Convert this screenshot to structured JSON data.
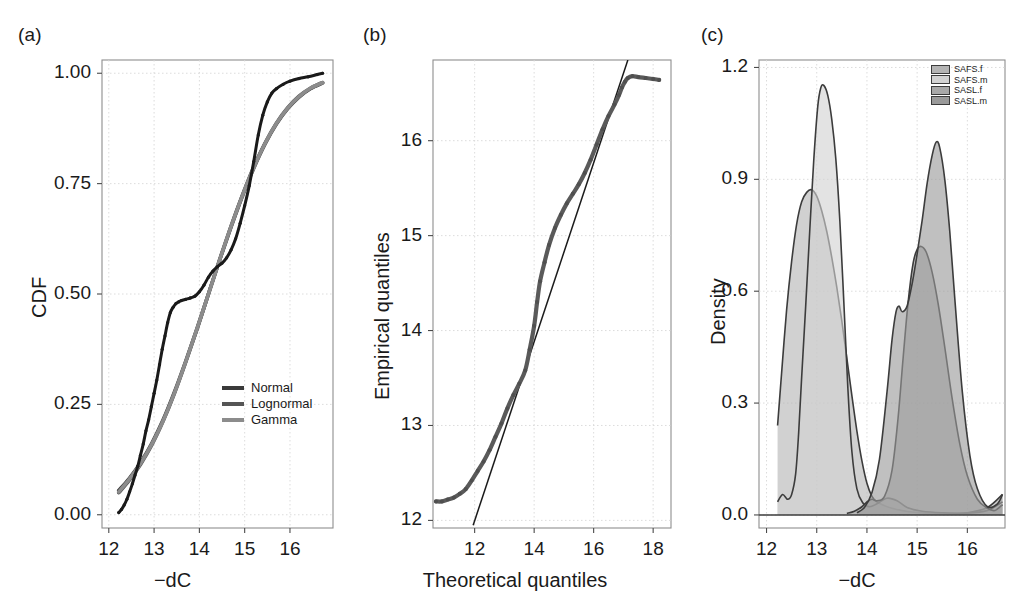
{
  "figure": {
    "width": 1029,
    "height": 614,
    "background": "#ffffff"
  },
  "panels": [
    {
      "label": "(a)",
      "name": "cdf-panel",
      "xlabel": "−dC",
      "ylabel": "CDF",
      "xticks": [
        "12",
        "13",
        "14",
        "15",
        "16"
      ],
      "yticks": [
        "0.00",
        "0.25",
        "0.50",
        "0.75",
        "1.00"
      ],
      "legend": [
        {
          "label": "Normal",
          "color": "#3a3a3a"
        },
        {
          "label": "Lognormal",
          "color": "#555555"
        },
        {
          "label": "Gamma",
          "color": "#8c8c8c"
        }
      ]
    },
    {
      "label": "(b)",
      "name": "qq-panel",
      "xlabel": "Theoretical quantiles",
      "ylabel": "Empirical quantiles",
      "xticks": [
        "12",
        "14",
        "16",
        "18"
      ],
      "yticks": [
        "12",
        "13",
        "14",
        "15",
        "16"
      ]
    },
    {
      "label": "(c)",
      "name": "density-panel",
      "xlabel": "−dC",
      "ylabel": "Density",
      "xticks": [
        "12",
        "13",
        "14",
        "15",
        "16"
      ],
      "yticks": [
        "0.0",
        "0.3",
        "0.6",
        "0.9",
        "1.2"
      ],
      "legend": [
        {
          "label": "SAFS.f",
          "color": "#b4b4b4"
        },
        {
          "label": "SAFS.m",
          "color": "#d2d2d2"
        },
        {
          "label": "SASL.f",
          "color": "#a8a8a8"
        },
        {
          "label": "SASL.m",
          "color": "#9a9a9a"
        }
      ]
    }
  ],
  "chart_data": [
    {
      "type": "line",
      "panel": "(a)",
      "title": "",
      "xlabel": "−dC",
      "ylabel": "CDF",
      "xlim": [
        11.85,
        16.95
      ],
      "ylim": [
        -0.03,
        1.03
      ],
      "grid": true,
      "legend_position": "bottom-right",
      "xticks": [
        12,
        13,
        14,
        15,
        16
      ],
      "yticks": [
        0.0,
        0.25,
        0.5,
        0.75,
        1.0
      ],
      "series": [
        {
          "name": "Empirical",
          "color": "#1a1a1a",
          "style": "points",
          "x": [
            12.22,
            12.28,
            12.34,
            12.4,
            12.46,
            12.52,
            12.58,
            12.64,
            12.7,
            12.76,
            12.82,
            12.88,
            12.94,
            13.0,
            13.06,
            13.12,
            13.18,
            13.24,
            13.3,
            13.36,
            13.42,
            13.48,
            13.54,
            13.6,
            13.7,
            13.8,
            13.9,
            14.0,
            14.1,
            14.2,
            14.3,
            14.4,
            14.5,
            14.6,
            14.7,
            14.8,
            14.9,
            15.0,
            15.1,
            15.2,
            15.3,
            15.4,
            15.5,
            15.6,
            15.7,
            15.85,
            16.0,
            16.2,
            16.4,
            16.6,
            16.72
          ],
          "y": [
            0.005,
            0.012,
            0.022,
            0.035,
            0.052,
            0.07,
            0.09,
            0.11,
            0.135,
            0.16,
            0.19,
            0.215,
            0.245,
            0.275,
            0.305,
            0.34,
            0.375,
            0.405,
            0.435,
            0.458,
            0.47,
            0.478,
            0.482,
            0.485,
            0.488,
            0.491,
            0.495,
            0.505,
            0.52,
            0.538,
            0.552,
            0.562,
            0.57,
            0.582,
            0.6,
            0.625,
            0.66,
            0.7,
            0.745,
            0.8,
            0.86,
            0.905,
            0.935,
            0.955,
            0.965,
            0.975,
            0.982,
            0.988,
            0.992,
            0.997,
            1.0
          ]
        },
        {
          "name": "Normal",
          "color": "#3a3a3a",
          "style": "line",
          "x": [
            12.22,
            12.45,
            12.7,
            12.95,
            13.2,
            13.45,
            13.7,
            13.95,
            14.2,
            14.45,
            14.7,
            14.95,
            15.2,
            15.45,
            15.7,
            15.95,
            16.2,
            16.45,
            16.72
          ],
          "y": [
            0.055,
            0.082,
            0.118,
            0.162,
            0.215,
            0.278,
            0.348,
            0.422,
            0.5,
            0.578,
            0.652,
            0.722,
            0.785,
            0.84,
            0.885,
            0.92,
            0.946,
            0.965,
            0.978
          ]
        },
        {
          "name": "Lognormal",
          "color": "#555555",
          "style": "line",
          "x": [
            12.22,
            12.45,
            12.7,
            12.95,
            13.2,
            13.45,
            13.7,
            13.95,
            14.2,
            14.45,
            14.7,
            14.95,
            15.2,
            15.45,
            15.7,
            15.95,
            16.2,
            16.45,
            16.72
          ],
          "y": [
            0.05,
            0.078,
            0.114,
            0.158,
            0.212,
            0.275,
            0.346,
            0.421,
            0.5,
            0.578,
            0.654,
            0.724,
            0.788,
            0.842,
            0.887,
            0.922,
            0.948,
            0.966,
            0.979
          ]
        },
        {
          "name": "Gamma",
          "color": "#8c8c8c",
          "style": "line",
          "x": [
            12.22,
            12.45,
            12.7,
            12.95,
            13.2,
            13.45,
            13.7,
            13.95,
            14.2,
            14.45,
            14.7,
            14.95,
            15.2,
            15.45,
            15.7,
            15.95,
            16.2,
            16.45,
            16.72
          ],
          "y": [
            0.052,
            0.08,
            0.116,
            0.16,
            0.213,
            0.276,
            0.347,
            0.422,
            0.5,
            0.578,
            0.653,
            0.723,
            0.786,
            0.841,
            0.886,
            0.921,
            0.947,
            0.966,
            0.979
          ]
        }
      ]
    },
    {
      "type": "scatter",
      "panel": "(b)",
      "title": "",
      "xlabel": "Theoretical quantiles",
      "ylabel": "Empirical quantiles",
      "xlim": [
        10.6,
        18.6
      ],
      "ylim": [
        11.92,
        16.85
      ],
      "grid": true,
      "xticks": [
        12,
        14,
        16,
        18
      ],
      "yticks": [
        12,
        13,
        14,
        15,
        16
      ],
      "series": [
        {
          "name": "Q-Q points",
          "color": "#5a5a5a",
          "style": "points",
          "x": [
            10.7,
            10.9,
            11.1,
            11.3,
            11.5,
            11.7,
            11.9,
            12.1,
            12.3,
            12.5,
            12.7,
            12.9,
            13.1,
            13.3,
            13.5,
            13.7,
            13.85,
            14.0,
            14.1,
            14.2,
            14.35,
            14.5,
            14.7,
            14.9,
            15.1,
            15.3,
            15.5,
            15.7,
            15.9,
            16.1,
            16.3,
            16.5,
            16.7,
            16.85,
            16.95,
            17.05,
            17.15,
            17.3,
            17.5,
            17.75,
            18.0,
            18.2
          ],
          "y": [
            12.2,
            12.2,
            12.22,
            12.24,
            12.28,
            12.33,
            12.42,
            12.52,
            12.62,
            12.74,
            12.88,
            13.02,
            13.18,
            13.32,
            13.44,
            13.58,
            13.8,
            14.05,
            14.3,
            14.52,
            14.72,
            14.9,
            15.08,
            15.22,
            15.34,
            15.44,
            15.54,
            15.66,
            15.8,
            15.96,
            16.12,
            16.26,
            16.38,
            16.48,
            16.56,
            16.62,
            16.66,
            16.68,
            16.67,
            16.66,
            16.65,
            16.64
          ]
        },
        {
          "name": "Reference line",
          "color": "#1a1a1a",
          "style": "line",
          "x": [
            11.95,
            17.15
          ],
          "y": [
            11.95,
            16.85
          ]
        }
      ]
    },
    {
      "type": "area",
      "panel": "(c)",
      "title": "",
      "xlabel": "−dC",
      "ylabel": "Density",
      "xlim": [
        11.85,
        16.75
      ],
      "ylim": [
        -0.035,
        1.22
      ],
      "grid": true,
      "legend_position": "top-right",
      "xticks": [
        12,
        13,
        14,
        15,
        16
      ],
      "yticks": [
        0.0,
        0.3,
        0.6,
        0.9,
        1.2
      ],
      "series": [
        {
          "name": "SAFS.f",
          "color": "#b4b4b4",
          "peak_x": 12.9,
          "peak_y": 0.87,
          "x": [
            12.22,
            12.3,
            12.4,
            12.5,
            12.6,
            12.7,
            12.8,
            12.9,
            13.0,
            13.1,
            13.2,
            13.3,
            13.4,
            13.5,
            13.6,
            13.7,
            13.8,
            13.9,
            14.0,
            14.1,
            14.2,
            14.35,
            14.5,
            14.7,
            14.9,
            15.2,
            15.6,
            16.0,
            16.4,
            16.7
          ],
          "y": [
            0.24,
            0.38,
            0.55,
            0.68,
            0.78,
            0.84,
            0.865,
            0.872,
            0.855,
            0.815,
            0.76,
            0.69,
            0.61,
            0.52,
            0.42,
            0.32,
            0.225,
            0.145,
            0.085,
            0.05,
            0.035,
            0.025,
            0.018,
            0.012,
            0.008,
            0.005,
            0.004,
            0.006,
            0.02,
            0.055
          ]
        },
        {
          "name": "SAFS.m",
          "color": "#d2d2d2",
          "peak_x": 13.1,
          "peak_y": 1.15,
          "x": [
            12.22,
            12.32,
            12.42,
            12.5,
            12.58,
            12.64,
            12.7,
            12.78,
            12.86,
            12.94,
            13.02,
            13.08,
            13.14,
            13.22,
            13.3,
            13.38,
            13.46,
            13.54,
            13.62,
            13.7,
            13.8,
            13.92,
            14.05,
            14.2,
            14.4,
            14.6,
            14.8,
            15.1,
            15.5,
            16.0,
            16.4,
            16.7
          ],
          "y": [
            0.035,
            0.055,
            0.042,
            0.055,
            0.11,
            0.22,
            0.37,
            0.56,
            0.76,
            0.95,
            1.095,
            1.145,
            1.152,
            1.125,
            1.06,
            0.955,
            0.79,
            0.57,
            0.34,
            0.17,
            0.07,
            0.032,
            0.022,
            0.03,
            0.045,
            0.038,
            0.02,
            0.01,
            0.006,
            0.005,
            0.012,
            0.035
          ]
        },
        {
          "name": "SASL.f",
          "color": "#a8a8a8",
          "peak_x": 15.05,
          "peak_y": 0.72,
          "x": [
            13.6,
            13.75,
            13.9,
            14.0,
            14.1,
            14.2,
            14.35,
            14.5,
            14.62,
            14.72,
            14.82,
            14.92,
            15.0,
            15.08,
            15.18,
            15.3,
            15.42,
            15.55,
            15.7,
            15.85,
            16.0,
            16.2,
            16.4,
            16.55,
            16.7
          ],
          "y": [
            0.004,
            0.01,
            0.022,
            0.035,
            0.042,
            0.038,
            0.05,
            0.12,
            0.26,
            0.42,
            0.57,
            0.675,
            0.712,
            0.72,
            0.705,
            0.65,
            0.565,
            0.45,
            0.31,
            0.19,
            0.105,
            0.042,
            0.018,
            0.012,
            0.028
          ]
        },
        {
          "name": "SASL.m",
          "color": "#9a9a9a",
          "peak_x": 15.35,
          "peak_y": 1.0,
          "x": [
            13.8,
            13.95,
            14.1,
            14.25,
            14.4,
            14.5,
            14.58,
            14.64,
            14.7,
            14.8,
            14.9,
            15.0,
            15.1,
            15.2,
            15.3,
            15.38,
            15.45,
            15.55,
            15.65,
            15.75,
            15.9,
            16.05,
            16.2,
            16.4,
            16.6,
            16.7
          ],
          "y": [
            0.006,
            0.02,
            0.06,
            0.15,
            0.33,
            0.47,
            0.545,
            0.56,
            0.545,
            0.56,
            0.62,
            0.7,
            0.79,
            0.89,
            0.965,
            1.0,
            0.985,
            0.9,
            0.76,
            0.58,
            0.33,
            0.16,
            0.07,
            0.022,
            0.03,
            0.055
          ]
        }
      ]
    }
  ]
}
